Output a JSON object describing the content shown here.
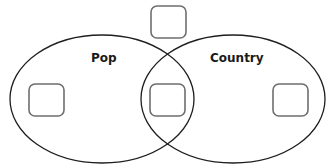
{
  "diagram": {
    "type": "venn",
    "sets": [
      {
        "id": "pop",
        "label": "Pop"
      },
      {
        "id": "country",
        "label": "Country"
      }
    ],
    "regions": [
      {
        "id": "neither",
        "description": "outside both sets",
        "value": ""
      },
      {
        "id": "pop-only",
        "description": "Pop only",
        "value": ""
      },
      {
        "id": "both",
        "description": "Pop and Country",
        "value": ""
      },
      {
        "id": "country-only",
        "description": "Country only",
        "value": ""
      }
    ],
    "colors": {
      "ellipse_stroke": "#1e1e1e",
      "box_stroke": "#6e6e6e",
      "label_text": "#1a1a1a",
      "background": "#ffffff"
    }
  }
}
